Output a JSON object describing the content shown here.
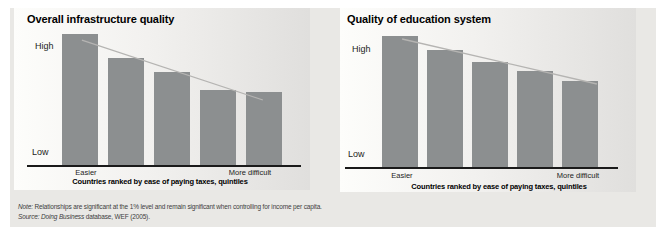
{
  "colors": {
    "bar": "#8c8f90",
    "trendline": "#b5b4b2",
    "axis": "#1a1a1a",
    "panel_background": "#e9e8e5",
    "plot_gradient_start": "#fdfdfb",
    "plot_gradient_end": "#e0dfdd",
    "note_text": "#3d3d3d"
  },
  "chart_data": [
    {
      "type": "bar",
      "title": "Overall infrastructure quality",
      "categories": [
        "quintile 1",
        "quintile 2",
        "quintile 3",
        "quintile 4",
        "quintile 5"
      ],
      "values": [
        1.0,
        0.82,
        0.71,
        0.57,
        0.56
      ],
      "scale": "qualitative axis, Low = 0 to High = 1",
      "ylabel_top": "High",
      "ylabel_bottom": "Low",
      "x_end_labels": [
        "Easier",
        "More difficult"
      ],
      "xlabel": "Countries ranked by ease of paying taxes, quintiles",
      "legend": "none",
      "grid": false,
      "trendline": {
        "x1": 0.201,
        "y1": 0.204,
        "x2": 0.864,
        "y2": 0.586
      }
    },
    {
      "type": "bar",
      "title": "Quality of education system",
      "categories": [
        "quintile 1",
        "quintile 2",
        "quintile 3",
        "quintile 4",
        "quintile 5"
      ],
      "values": [
        1.0,
        0.89,
        0.8,
        0.73,
        0.66
      ],
      "scale": "qualitative axis, Low = 0 to High = 1",
      "ylabel_top": "High",
      "ylabel_bottom": "Low",
      "x_end_labels": [
        "Easier",
        "More difficult"
      ],
      "xlabel": "Countries ranked by ease of paying taxes, quintiles",
      "legend": "none",
      "grid": false,
      "trendline": {
        "x1": 0.21,
        "y1": 0.195,
        "x2": 0.926,
        "y2": 0.478
      }
    }
  ],
  "footnote": {
    "note_italic": "Note:",
    "note_rest": " Relationships are significant at the 1% level and remain significant when controlling for income per capita.",
    "source_italic": "Source: Doing Business",
    "source_rest": " database, WEF (2005)."
  }
}
